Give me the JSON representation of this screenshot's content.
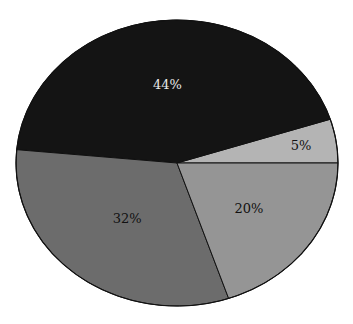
{
  "chart_data": {
    "type": "pie",
    "title": "",
    "start_angle_deg": 0,
    "direction": "counterclockwise",
    "slices": [
      {
        "label": "5%",
        "value": 5,
        "color": "#b4b4b4",
        "text_color": "#111111"
      },
      {
        "label": "44%",
        "value": 44,
        "color": "#141414",
        "text_color": "#e8e8e8"
      },
      {
        "label": "32%",
        "value": 32,
        "color": "#6c6c6c",
        "text_color": "#111111"
      },
      {
        "label": "20%",
        "value": 20,
        "color": "#959595",
        "text_color": "#111111"
      }
    ],
    "values": [
      5,
      44,
      32,
      20
    ],
    "categories": [
      "5%",
      "44%",
      "32%",
      "20%"
    ],
    "legend": null
  },
  "geometry": {
    "cx": 177,
    "cy": 163,
    "rx": 161,
    "ry": 143,
    "outline": "#111111"
  }
}
